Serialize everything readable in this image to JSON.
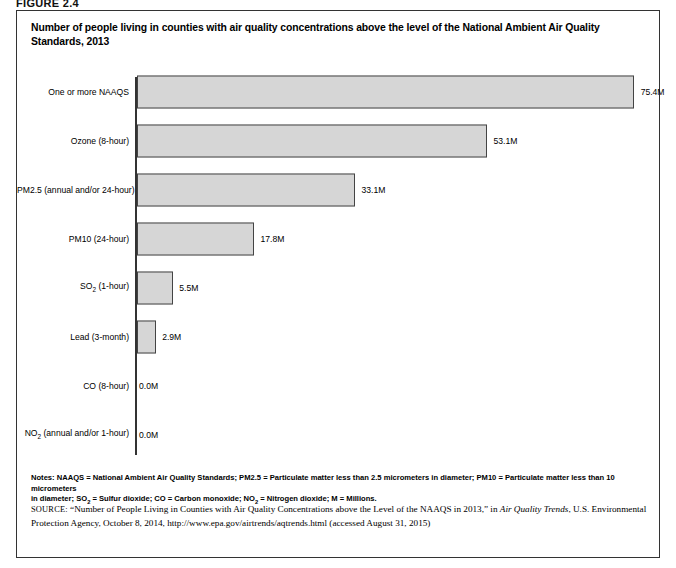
{
  "figure": {
    "label": "FIGURE 2.4",
    "title": "Number of people living in counties with air quality concentrations above the level of the National Ambient Air Quality Standards, 2013"
  },
  "chart_data": {
    "type": "bar",
    "orientation": "horizontal",
    "title": "Number of people living in counties with air quality concentrations above the level of the National Ambient Air Quality Standards, 2013",
    "xlabel": "",
    "ylabel": "",
    "xlim": [
      0,
      75.4
    ],
    "grid": false,
    "legend": "none",
    "units": "Millions of people",
    "categories": [
      "One or more NAAQS",
      "Ozone (8-hour)",
      "PM2.5 (annual and/or 24-hour)",
      "PM10 (24-hour)",
      "SO2 (1-hour)",
      "Lead (3-month)",
      "CO (8-hour)",
      "NO2 (annual and/or 1-hour)"
    ],
    "values": [
      75.4,
      53.1,
      33.1,
      17.8,
      5.5,
      2.9,
      0.0,
      0.0
    ],
    "value_labels": [
      "75.4M",
      "53.1M",
      "33.1M",
      "17.8M",
      "5.5M",
      "2.9M",
      "0.0M",
      "0.0M"
    ],
    "bars": [
      {
        "category_html": "One or more NAAQS",
        "value": 75.4,
        "label": "75.4M"
      },
      {
        "category_html": "Ozone (8-hour)",
        "value": 53.1,
        "label": "53.1M"
      },
      {
        "category_html": "PM2.5 (annual and/or 24-hour)",
        "value": 33.1,
        "label": "33.1M"
      },
      {
        "category_html": "PM10 (24-hour)",
        "value": 17.8,
        "label": "17.8M"
      },
      {
        "category_html": "SO<sub>2</sub> (1-hour)",
        "value": 5.5,
        "label": "5.5M"
      },
      {
        "category_html": "Lead (3-month)",
        "value": 2.9,
        "label": "2.9M"
      },
      {
        "category_html": "CO (8-hour)",
        "value": 0.0,
        "label": "0.0M"
      },
      {
        "category_html": "NO<sub>2</sub> (annual and/or 1-hour)",
        "value": 0.0,
        "label": "0.0M"
      }
    ],
    "bar_fill_color": "#d6d6d6",
    "bar_border_color": "#444444"
  },
  "notes": {
    "line1_html": "<b>Notes:</b> NAAQS = National Ambient Air Quality Standards; PM2.5 = Particulate matter less than 2.5 micrometers in diameter; PM10 = Particulate matter less than 10 micrometers",
    "line2_html": "in diameter; SO<sub>2</sub> = Sulfur dioxide; CO = Carbon monoxide; NO<sub>2</sub> = Nitrogen dioxide; M = Millions.",
    "text": "Notes: NAAQS = National Ambient Air Quality Standards; PM2.5 = Particulate matter less than 2.5 micrometers in diameter; PM10 = Particulate matter less than 10 micrometers in diameter; SO2 = Sulfur dioxide; CO = Carbon monoxide; NO2 = Nitrogen dioxide; M = Millions."
  },
  "source": {
    "prefix": "SOURCE:",
    "citation_title": "“Number of People Living in Counties with Air Quality Concentrations above the Level of the NAAQS in 2013,”",
    "in_word": "in",
    "publication": "Air Quality Trends",
    "publisher": ", U.S. Environmental Protection Agency, October 8, 2014, http://www.epa.gov/airtrends/aqtrends.html (accessed August 31, 2015)"
  }
}
